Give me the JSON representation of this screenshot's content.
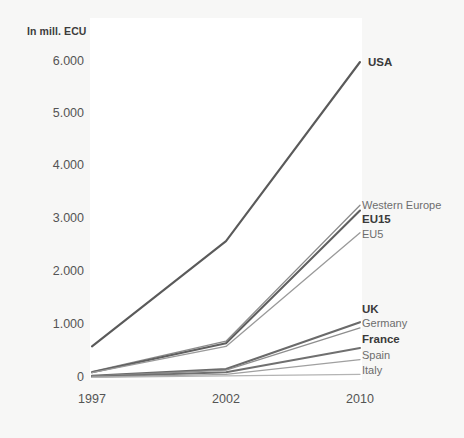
{
  "chart_data": {
    "type": "line",
    "title": "In mill. ECU",
    "xlabel": "",
    "ylabel": "In mill. ECU",
    "x": [
      1997,
      2002,
      2010
    ],
    "categories": [
      "1997",
      "2002",
      "2010"
    ],
    "xtick_labels": [
      "1997",
      "2002",
      "2010"
    ],
    "ytick_labels": [
      "0",
      "1.000",
      "2.000",
      "3.000",
      "4.000",
      "5.000",
      "6.000"
    ],
    "ytick_values": [
      0,
      1000,
      2000,
      3000,
      4000,
      5000,
      6000
    ],
    "ylim": [
      0,
      6300
    ],
    "grid": false,
    "legend_position": "right-inline",
    "series": [
      {
        "name": "USA",
        "emphasis": "bold",
        "color": "#5a5a5a",
        "values": [
          600,
          2600,
          6000
        ]
      },
      {
        "name": "Western Europe",
        "emphasis": "normal",
        "color": "#8c8c8c",
        "values": [
          120,
          700,
          3280
        ]
      },
      {
        "name": "EU15",
        "emphasis": "bold",
        "color": "#606060",
        "values": [
          110,
          660,
          3180
        ]
      },
      {
        "name": "EU5",
        "emphasis": "normal",
        "color": "#9a9a9a",
        "values": [
          100,
          600,
          2760
        ]
      },
      {
        "name": "UK",
        "emphasis": "bold",
        "color": "#6a6a6a",
        "values": [
          40,
          170,
          1060
        ]
      },
      {
        "name": "Germany",
        "emphasis": "normal",
        "color": "#8e8e8e",
        "values": [
          35,
          150,
          950
        ]
      },
      {
        "name": "France",
        "emphasis": "bold",
        "color": "#707070",
        "values": [
          25,
          110,
          570
        ]
      },
      {
        "name": "Spain",
        "emphasis": "normal",
        "color": "#a0a0a0",
        "values": [
          15,
          70,
          350
        ]
      },
      {
        "name": "Italy",
        "emphasis": "normal",
        "color": "#b4b4b4",
        "values": [
          10,
          40,
          70
        ]
      }
    ]
  },
  "axis_title": "In mill. ECU",
  "yticks": [
    {
      "label": "6.000",
      "y": 62
    },
    {
      "label": "5.000",
      "y": 114
    },
    {
      "label": "4.000",
      "y": 166
    },
    {
      "label": "3.000",
      "y": 219
    },
    {
      "label": "2.000",
      "y": 272
    },
    {
      "label": "1.000",
      "y": 325
    },
    {
      "label": "0",
      "y": 378
    }
  ],
  "xticks": [
    {
      "label": "1997",
      "x": 92
    },
    {
      "label": "2002",
      "x": 226
    },
    {
      "label": "2010",
      "x": 360
    }
  ],
  "series_labels": [
    {
      "name": "USA",
      "x": 368,
      "y": 57,
      "bold": true
    },
    {
      "name": "Western Europe",
      "x": 362,
      "y": 200,
      "bold": false
    },
    {
      "name": "EU15",
      "x": 362,
      "y": 214,
      "bold": true
    },
    {
      "name": "EU5",
      "x": 362,
      "y": 229,
      "bold": false
    },
    {
      "name": "UK",
      "x": 362,
      "y": 304,
      "bold": true
    },
    {
      "name": "Germany",
      "x": 362,
      "y": 318,
      "bold": false
    },
    {
      "name": "France",
      "x": 362,
      "y": 334,
      "bold": true
    },
    {
      "name": "Spain",
      "x": 362,
      "y": 350,
      "bold": false
    },
    {
      "name": "Italy",
      "x": 362,
      "y": 365,
      "bold": false
    }
  ],
  "colors": {
    "background": "#f7f7f6",
    "panel": "#ffffff",
    "tick_text": "#545454",
    "label_text": "#6d6d6d",
    "label_bold_text": "#3a3a3a"
  }
}
